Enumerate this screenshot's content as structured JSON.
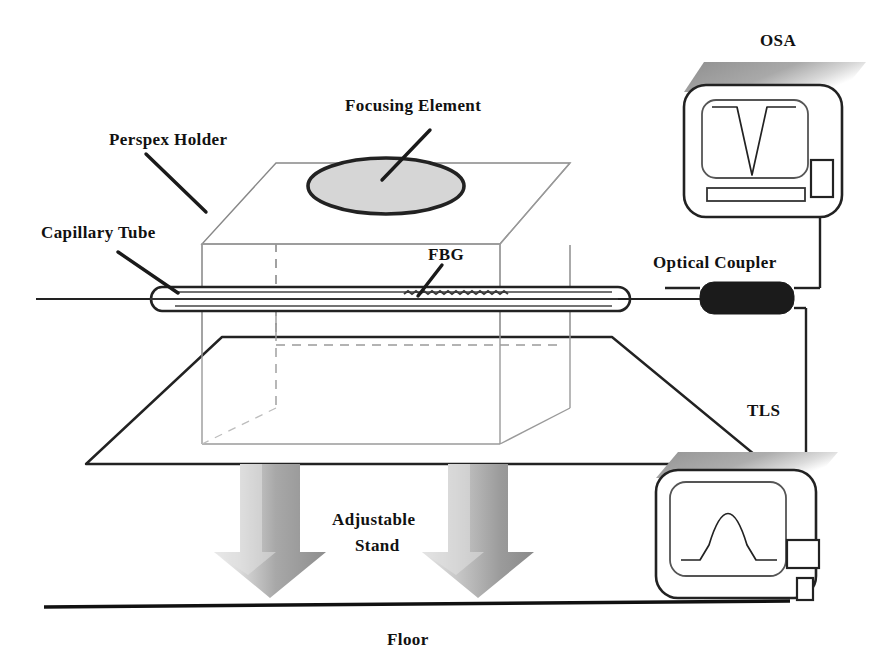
{
  "figure": {
    "kind": "experimental-setup-schematic",
    "background_color": "#ffffff",
    "line_color": "#111111"
  },
  "labels": {
    "perspex_holder": "Perspex Holder",
    "capillary_tube": "Capillary Tube",
    "focusing_element": "Focusing Element",
    "fbg": "FBG",
    "osa": "OSA",
    "optical_coupler": "Optical Coupler",
    "tls": "TLS",
    "adjustable_stand_line1": "Adjustable",
    "adjustable_stand_line2": "Stand",
    "floor": "Floor"
  },
  "components": {
    "perspex_holder": {
      "name": "Perspex Holder",
      "shape": "transparent-rectangular-box",
      "stroke": "#555555",
      "hidden_edge_style": "dashed"
    },
    "focusing_element": {
      "name": "Focusing Element",
      "shape": "ellipse",
      "fill": "#d4d4d4",
      "stroke": "#222222",
      "stroke_width": 3.5
    },
    "capillary_tube": {
      "name": "Capillary Tube",
      "shape": "long-thin-rounded-tube",
      "stroke": "#222222"
    },
    "fbg": {
      "name": "FBG",
      "shape": "grating-serration-on-fiber",
      "stroke": "#333333"
    },
    "optical_coupler": {
      "name": "Optical Coupler",
      "shape": "filled-rounded-rectangle",
      "fill": "#1a1a1a"
    },
    "adjustable_stand": {
      "name": "Adjustable Stand",
      "shape": "two-downward-block-arrows",
      "gradient_from": "#e8e8e8",
      "gradient_to": "#8a8a8a",
      "arrow_count": 2
    },
    "stand_plate": {
      "name": "Stand Plate",
      "shape": "perspective-parallelogram",
      "fill": "#ffffff",
      "stroke": "#222222"
    },
    "floor": {
      "name": "Floor",
      "shape": "horizontal-line",
      "stroke": "#111111"
    }
  },
  "instruments": [
    {
      "id": "osa",
      "label": "OSA",
      "full_name": "Optical Spectrum Analyzer",
      "trace_type": "notch",
      "trace_description": "V-shaped absorption dip",
      "has_display_bar": true,
      "port_label": "",
      "body_stroke": "#222222",
      "shadow_color": "#b5b5b5"
    },
    {
      "id": "tls",
      "label": "TLS",
      "full_name": "Tunable Laser Source",
      "trace_type": "peak",
      "trace_description": "bell-shaped emission peak",
      "has_display_bar": false,
      "port_label": "",
      "body_stroke": "#222222",
      "shadow_color": "#b5b5b5"
    }
  ],
  "connections": [
    {
      "from": "fbg-fiber",
      "to": "optical-coupler"
    },
    {
      "from": "optical-coupler",
      "to": "osa-port"
    },
    {
      "from": "optical-coupler",
      "to": "tls-port"
    }
  ]
}
